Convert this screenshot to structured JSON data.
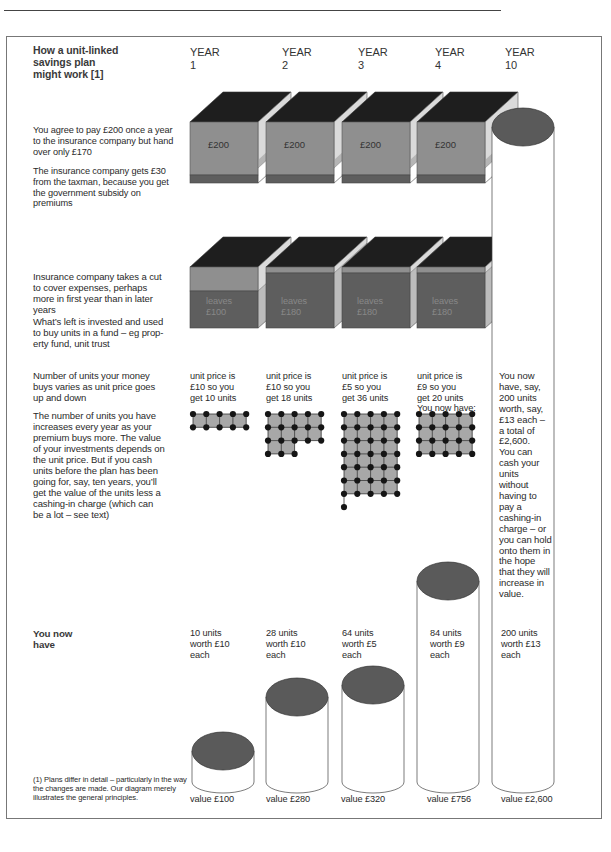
{
  "header": {
    "title": "How a unit-linked\nsavings plan\nmight work [1]"
  },
  "years": [
    {
      "label": "YEAR\n1"
    },
    {
      "label": "YEAR\n2"
    },
    {
      "label": "YEAR\n3"
    },
    {
      "label": "YEAR\n4"
    },
    {
      "label": "YEAR\n10"
    }
  ],
  "row_payment": {
    "text1": "You agree to pay £200 once a year\nto the insurance company but hand\nover only £170",
    "text2": "The insurance company gets £30\nfrom the taxman, because you get\nthe government subsidy on\npremiums",
    "blocks": [
      "£200",
      "£200",
      "£200",
      "£200"
    ]
  },
  "row_cut": {
    "text1": "Insurance company takes a cut\nto cover expenses, perhaps\nmore in first year than in later\nyears",
    "text2": "What’s left is invested and used\nto buy units in a fund – eg prop-\nerty fund, unit trust",
    "blocks": [
      "leaves\n£100",
      "leaves\n£180",
      "leaves\n£180",
      "leaves\n£180"
    ]
  },
  "row_units": {
    "text1": "Number of units your money\nbuys varies as unit price goes\nup and down",
    "text2": "The number of units you have\nincreases every year as your\npremium buys more. The value\nof your investments depends on\nthe unit price. But if you cash\nunits before the plan has been\ngoing for, say, ten years, you’ll\nget the value of the units less a\ncashing-in charge (which can\nbe a lot – see text)",
    "columns": [
      {
        "text": "unit price is\n£10 so you\nget 10 units",
        "units": 10
      },
      {
        "text": "unit price is\n£10 so you\nget 18 units",
        "units": 18
      },
      {
        "text": "unit price is\n£5 so you\nget 36 units",
        "units": 36
      },
      {
        "text": "unit price is\n£9 so you\nget 20 units\nYou now have:",
        "units": 20
      }
    ],
    "year10_text": "You now\nhave, say,\n200 units\nworth, say,\n£13 each –\na total of\n£2,600.\nYou can\ncash your\nunits\nwithout\nhaving to\npay a\ncashing-in\ncharge – or\nyou can hold\nonto them in\nthe hope\nthat  they will\nincrease in\nvalue."
  },
  "row_have": {
    "label": "You now\nhave",
    "columns": [
      {
        "text": "10 units\nworth £10\neach",
        "value": "value £100"
      },
      {
        "text": "28 units\nworth £10\neach",
        "value": "value £280"
      },
      {
        "text": "64 units\nworth £5\neach",
        "value": "value £320"
      },
      {
        "text": "84 units\nworth £9\neach",
        "value": "value £756"
      },
      {
        "text": "200 units\nworth £13\neach",
        "value": "value £2,600"
      }
    ]
  },
  "footnote": "(1) Plans differ in detail – particularly in the way\nthe changes are made. Our diagram merely\nillustrates the general principles.",
  "colors": {
    "cube_top": "#1e1e1e",
    "cube_front": "#8f8f8f",
    "cube_side": "#d9d9d9",
    "cube_base": "#5e5e5e",
    "cylinder_top": "#5a5a5a",
    "dot": "#151515",
    "grid_fill": "#a8a8a8"
  },
  "chart_data": {
    "type": "table",
    "title": "How a unit-linked savings plan might work",
    "categories": [
      "Year 1",
      "Year 2",
      "Year 3",
      "Year 4",
      "Year 10"
    ],
    "series": [
      {
        "name": "Premium paid (£)",
        "values": [
          200,
          200,
          200,
          200,
          null
        ]
      },
      {
        "name": "Invested after cut (£)",
        "values": [
          100,
          180,
          180,
          180,
          null
        ]
      },
      {
        "name": "Unit price (£)",
        "values": [
          10,
          10,
          5,
          9,
          13
        ]
      },
      {
        "name": "Units bought",
        "values": [
          10,
          18,
          36,
          20,
          null
        ]
      },
      {
        "name": "Total units held",
        "values": [
          10,
          28,
          64,
          84,
          200
        ]
      },
      {
        "name": "Value (£)",
        "values": [
          100,
          280,
          320,
          756,
          2600
        ]
      }
    ]
  }
}
